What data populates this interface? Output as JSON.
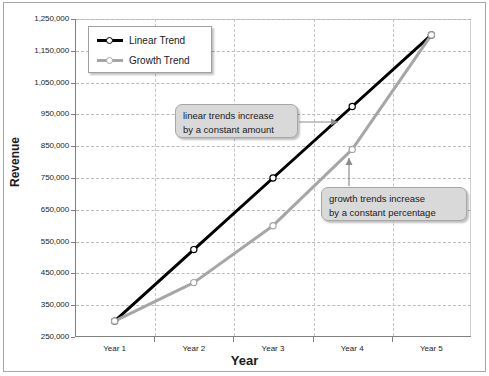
{
  "chart_data": {
    "type": "line",
    "title": "",
    "xlabel": "Year",
    "ylabel": "Revenue",
    "categories": [
      "Year 1",
      "Year 2",
      "Year 3",
      "Year 4",
      "Year 5"
    ],
    "series": [
      {
        "name": "Linear Trend",
        "color": "#000000",
        "marker": "open-circle",
        "values": [
          300000,
          525000,
          750000,
          975000,
          1200000
        ]
      },
      {
        "name": "Growth Trend",
        "color": "#a6a6a6",
        "marker": "open-circle",
        "values": [
          300000,
          421000,
          600000,
          840000,
          1200000
        ]
      }
    ],
    "ylim": [
      250000,
      1250000
    ],
    "ytick_step": 100000,
    "ytick_labels": [
      "1,250,000",
      "1,150,000",
      "1,050,000",
      "950,000",
      "850,000",
      "750,000",
      "650,000",
      "550,000",
      "450,000",
      "350,000",
      "250,000"
    ],
    "grid": {
      "horizontal": true,
      "vertical": true,
      "style": "dashed"
    },
    "legend": {
      "position": "top-left-inside",
      "entries": [
        "Linear Trend",
        "Growth Trend"
      ]
    },
    "annotations": [
      {
        "id": "linear-callout",
        "line1": "linear trends increase",
        "line2": "by a constant amount",
        "points_to": "Linear Trend line between Year 3 and Year 4"
      },
      {
        "id": "growth-callout",
        "line1": "growth trends increase",
        "line2": "by a constant percentage",
        "points_to": "Growth Trend line at Year 4"
      }
    ]
  },
  "colors": {
    "linear_series": "#000000",
    "growth_series": "#a6a6a6",
    "callout_fill": "#d9d9d9",
    "callout_border": "#a6a6a6",
    "gridline": "#b9b9b9",
    "axis": "#808080",
    "frame": "#a6a6a6",
    "text": "#1a1a1a"
  }
}
